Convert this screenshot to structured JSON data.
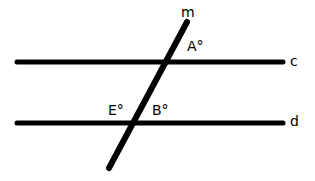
{
  "diagram": {
    "lines": [
      {
        "id": "c",
        "label": "c",
        "x1": 17,
        "y1": 62,
        "x2": 283,
        "y2": 62
      },
      {
        "id": "d",
        "label": "d",
        "x1": 17,
        "y1": 123,
        "x2": 283,
        "y2": 123
      },
      {
        "id": "m",
        "label": "m",
        "x1": 109,
        "y1": 168,
        "x2": 187,
        "y2": 22
      }
    ],
    "angles": [
      {
        "label": "A°",
        "near": "intersection of m and c"
      },
      {
        "label": "E°",
        "near": "intersection of m and d (left)"
      },
      {
        "label": "B°",
        "near": "intersection of m and d (right)"
      }
    ],
    "stroke_color": "#000000",
    "background": "#ffffff"
  },
  "labels": {
    "m": "m",
    "c": "c",
    "d": "d",
    "A": "A°",
    "E": "E°",
    "B": "B°"
  }
}
